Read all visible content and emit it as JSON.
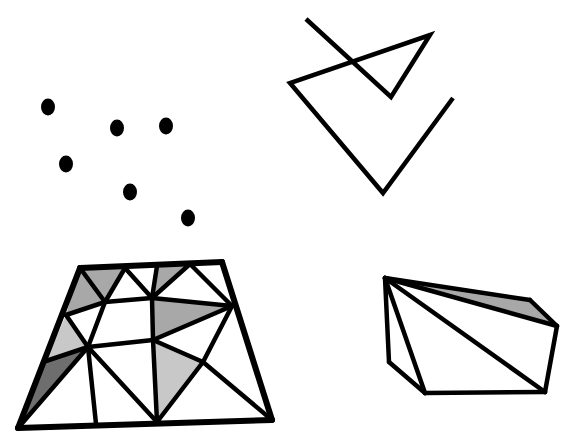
{
  "background": "#ffffff",
  "colors": {
    "stroke": "#000000",
    "shade_light": "#c8c8c8",
    "shade_mid": "#a8a8a8",
    "shade_dark": "#6e6e6e"
  },
  "point_set": {
    "points": [
      [
        48,
        107
      ],
      [
        117,
        128
      ],
      [
        166,
        126
      ],
      [
        66,
        164
      ],
      [
        130,
        192
      ],
      [
        188,
        218
      ]
    ],
    "rx": 7,
    "ry": 8.5
  },
  "polygonal_chain": {
    "points": [
      [
        306,
        19
      ],
      [
        391,
        97
      ],
      [
        430,
        35
      ],
      [
        290,
        83
      ],
      [
        383,
        193
      ],
      [
        453,
        98
      ]
    ],
    "stroke_width": 4.5
  },
  "triangulation": {
    "vertices": {
      "A": [
        80,
        268
      ],
      "B": [
        222,
        262
      ],
      "C": [
        272,
        420
      ],
      "D": [
        18,
        428
      ],
      "E": [
        125,
        268
      ],
      "F": [
        157,
        266
      ],
      "G": [
        190,
        264
      ],
      "H": [
        105,
        302
      ],
      "I": [
        152,
        298
      ],
      "J": [
        232,
        306
      ],
      "K": [
        66,
        315
      ],
      "L": [
        88,
        347
      ],
      "M": [
        153,
        340
      ],
      "N": [
        203,
        362
      ],
      "O": [
        46,
        361
      ],
      "P": [
        96,
        424
      ],
      "Q": [
        157,
        422
      ]
    },
    "shaded": [
      {
        "tri": [
          "A",
          "E",
          "H"
        ],
        "fill": "shade_mid"
      },
      {
        "tri": [
          "A",
          "H",
          "K"
        ],
        "fill": "shade_mid"
      },
      {
        "tri": [
          "F",
          "G",
          "I"
        ],
        "fill": "shade_mid"
      },
      {
        "tri": [
          "I",
          "J",
          "M"
        ],
        "fill": "shade_mid"
      },
      {
        "tri": [
          "K",
          "L",
          "O"
        ],
        "fill": "shade_light"
      },
      {
        "tri": [
          "O",
          "L",
          "D"
        ],
        "fill": "shade_dark"
      },
      {
        "tri": [
          "M",
          "N",
          "Q"
        ],
        "fill": "shade_light"
      }
    ],
    "edges": [
      [
        "A",
        "B"
      ],
      [
        "B",
        "C"
      ],
      [
        "C",
        "D"
      ],
      [
        "D",
        "A"
      ],
      [
        "A",
        "H"
      ],
      [
        "E",
        "H"
      ],
      [
        "E",
        "I"
      ],
      [
        "F",
        "I"
      ],
      [
        "G",
        "I"
      ],
      [
        "G",
        "J"
      ],
      [
        "H",
        "K"
      ],
      [
        "H",
        "I"
      ],
      [
        "I",
        "J"
      ],
      [
        "H",
        "L"
      ],
      [
        "I",
        "M"
      ],
      [
        "J",
        "M"
      ],
      [
        "K",
        "L"
      ],
      [
        "L",
        "M"
      ],
      [
        "L",
        "O"
      ],
      [
        "L",
        "D"
      ],
      [
        "L",
        "P"
      ],
      [
        "L",
        "Q"
      ],
      [
        "M",
        "Q"
      ],
      [
        "M",
        "N"
      ],
      [
        "J",
        "N"
      ],
      [
        "N",
        "Q"
      ],
      [
        "N",
        "C"
      ]
    ],
    "outer_stroke_width": 6,
    "inner_stroke_width": 4.5
  },
  "convex_hull_3d": {
    "vertices": {
      "T": [
        385,
        278
      ],
      "U": [
        530,
        300
      ],
      "V": [
        557,
        326
      ],
      "W": [
        545,
        392
      ],
      "X": [
        425,
        393
      ],
      "Y": [
        389,
        362
      ]
    },
    "shaded": [
      {
        "tri": [
          "T",
          "U",
          "V"
        ],
        "fill": "shade_mid"
      }
    ],
    "edges": [
      [
        "T",
        "U"
      ],
      [
        "U",
        "V"
      ],
      [
        "V",
        "W"
      ],
      [
        "W",
        "X"
      ],
      [
        "X",
        "Y"
      ],
      [
        "Y",
        "T"
      ],
      [
        "T",
        "V"
      ],
      [
        "T",
        "X"
      ],
      [
        "T",
        "W"
      ]
    ],
    "stroke_width": 4.5
  }
}
